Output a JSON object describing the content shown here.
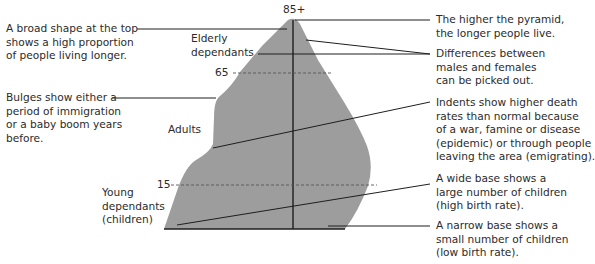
{
  "diagram": {
    "fill_color": "#9d9d9d",
    "line_color": "#1e1e1e",
    "age_labels": {
      "top": "85+",
      "elderly_boundary": "65",
      "young_boundary": "15"
    },
    "group_labels": {
      "elderly": "Elderly\ndependants",
      "adults": "Adults",
      "young": "Young\ndependants\n(children)"
    },
    "left_annotations": [
      {
        "id": "broad-top",
        "text": "A broad shape at the top\nshows a high proportion\nof people living longer."
      },
      {
        "id": "bulges",
        "text": "Bulges show either a\nperiod of immigration\nor a baby boom years\nbefore."
      }
    ],
    "right_annotations": [
      {
        "id": "higher-pyramid",
        "text": "The higher the pyramid,\nthe longer people live."
      },
      {
        "id": "male-female",
        "text": "Differences between\nmales and females\ncan be picked out."
      },
      {
        "id": "indents",
        "text": "Indents show higher death\nrates than normal because\nof a war, famine or disease\n(epidemic) or through people\nleaving the area (emigrating)."
      },
      {
        "id": "wide-base",
        "text": "A wide base shows a\nlarge number of children\n(high birth rate)."
      },
      {
        "id": "narrow-base",
        "text": "A narrow base shows a\nsmall number of children\n(low birth rate)."
      }
    ]
  }
}
